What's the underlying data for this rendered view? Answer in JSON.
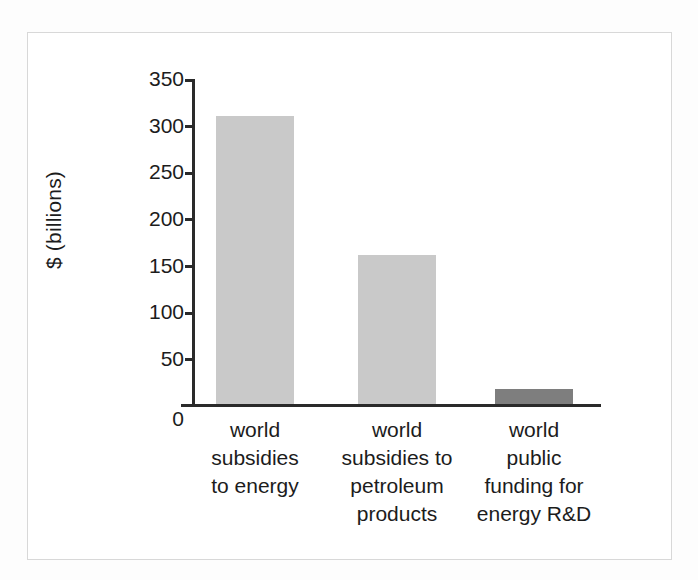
{
  "chart_data": {
    "type": "bar",
    "title": "",
    "subtitle": "",
    "xlabel": "",
    "ylabel": "$ (billions)",
    "categories": [
      "world subsidies to energy",
      "world subsidies to petroleum products",
      "world public funding for energy R&D"
    ],
    "category_lines": [
      [
        "world",
        "subsidies",
        "to energy"
      ],
      [
        "world",
        "subsidies to",
        "petroleum",
        "products"
      ],
      [
        "world",
        "public",
        "funding for",
        "energy R&D"
      ]
    ],
    "values": [
      310,
      160,
      16
    ],
    "bar_colors": [
      "#c9c9c9",
      "#c9c9c9",
      "#7e7e7e"
    ],
    "ylim": [
      0,
      350
    ],
    "yticks": [
      350,
      300,
      250,
      200,
      150,
      100,
      50,
      0
    ],
    "ytick_labels": [
      "350",
      "300",
      "250",
      "200",
      "150",
      "100",
      "50",
      "0"
    ],
    "grid": false,
    "legend": "none",
    "axis_color": "#2a2a2a"
  },
  "figure": {
    "border_color": "#d8d8d8",
    "background": "#ffffff"
  }
}
